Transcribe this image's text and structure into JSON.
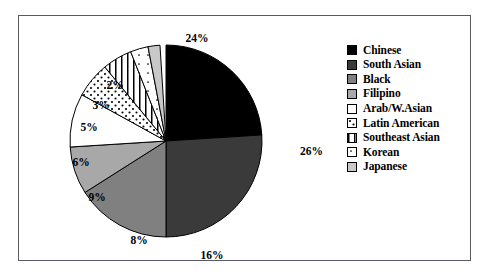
{
  "chart_data": {
    "type": "pie",
    "title": "",
    "xlabel": "",
    "ylabel": "",
    "legend_position": "right",
    "grid": false,
    "units": "percent",
    "categories": [
      "Chinese",
      "South Asian",
      "Black",
      "Filipino",
      "Arab/W.Asian",
      "Latin American",
      "Southeast Asian",
      "Korean",
      "Japanese"
    ],
    "values": [
      24,
      26,
      16,
      8,
      9,
      6,
      5,
      3,
      2
    ],
    "data_labels": [
      "24%",
      "26%",
      "16%",
      "8%",
      "9%",
      "6%",
      "5%",
      "3%",
      "2%"
    ],
    "slices": [
      {
        "label": "Chinese",
        "value": 24,
        "data_label": "24%",
        "fill": "#000000",
        "pattern": "solid",
        "start_deg": 0,
        "end_deg": 86.4,
        "label_x": 178,
        "label_y": 23,
        "label_anchor": "middle"
      },
      {
        "label": "South Asian",
        "value": 26,
        "data_label": "26%",
        "fill": "#3a3a3a",
        "pattern": "solid",
        "start_deg": 86.4,
        "end_deg": 180.0,
        "label_x": 281,
        "label_y": 136,
        "label_anchor": "start"
      },
      {
        "label": "Black",
        "value": 16,
        "data_label": "16%",
        "fill": "#808080",
        "pattern": "solid",
        "start_deg": 180.0,
        "end_deg": 237.6,
        "label_x": 193,
        "label_y": 240,
        "label_anchor": "middle"
      },
      {
        "label": "Filipino",
        "value": 8,
        "data_label": "8%",
        "fill": "#a8a8a8",
        "pattern": "solid",
        "start_deg": 237.6,
        "end_deg": 266.4,
        "label_x": 120,
        "label_y": 225,
        "label_anchor": "middle"
      },
      {
        "label": "Arab/W.Asian",
        "value": 9,
        "data_label": "9%",
        "fill": "#ffffff",
        "pattern": "solid",
        "start_deg": 266.4,
        "end_deg": 298.8,
        "label_x": 78,
        "label_y": 182,
        "label_anchor": "middle"
      },
      {
        "label": "Latin American",
        "value": 6,
        "data_label": "6%",
        "fill": "#ffffff",
        "pattern": "dots-dense",
        "start_deg": 298.8,
        "end_deg": 320.4,
        "label_x": 62,
        "label_y": 147,
        "label_anchor": "middle"
      },
      {
        "label": "Southeast Asian",
        "value": 5,
        "data_label": "5%",
        "fill": "#ffffff",
        "pattern": "vertical-lines",
        "start_deg": 320.4,
        "end_deg": 338.4,
        "label_x": 70,
        "label_y": 112,
        "label_anchor": "middle"
      },
      {
        "label": "Korean",
        "value": 3,
        "data_label": "3%",
        "fill": "#ffffff",
        "pattern": "dots-sparse",
        "start_deg": 338.4,
        "end_deg": 349.2,
        "label_x": 82,
        "label_y": 90,
        "label_anchor": "middle"
      },
      {
        "label": "Japanese",
        "value": 2,
        "data_label": "2%",
        "fill": "#c8c8c8",
        "pattern": "solid",
        "start_deg": 349.2,
        "end_deg": 356.4,
        "label_x": 96,
        "label_y": 70,
        "label_anchor": "middle"
      }
    ],
    "legend": [
      {
        "label": "Chinese",
        "swatch": "#000000",
        "pattern": "solid"
      },
      {
        "label": "South Asian",
        "swatch": "#3a3a3a",
        "pattern": "solid"
      },
      {
        "label": "Black",
        "swatch": "#808080",
        "pattern": "solid"
      },
      {
        "label": "Filipino",
        "swatch": "#a8a8a8",
        "pattern": "solid"
      },
      {
        "label": "Arab/W.Asian",
        "swatch": "#ffffff",
        "pattern": "solid"
      },
      {
        "label": "Latin American",
        "swatch": "#ffffff",
        "pattern": "dots-dense"
      },
      {
        "label": "Southeast Asian",
        "swatch": "#ffffff",
        "pattern": "vertical-lines"
      },
      {
        "label": "Korean",
        "swatch": "#ffffff",
        "pattern": "dots-sparse"
      },
      {
        "label": "Japanese",
        "swatch": "#c8c8c8",
        "pattern": "solid"
      }
    ]
  },
  "geometry": {
    "center_x": 147,
    "center_y": 125,
    "radius": 96
  },
  "frame": {
    "border_color": "#5a5a66"
  }
}
